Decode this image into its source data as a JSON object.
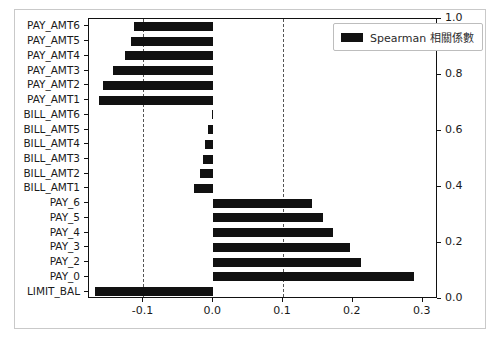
{
  "legend": {
    "label": "Spearman 相關係數",
    "swatch_color": "#111111"
  },
  "axis": {
    "x_ticks": [
      "-0.1",
      "0.0",
      "0.1",
      "0.2",
      "0.3"
    ],
    "right_ticks": [
      "0.0",
      "0.2",
      "0.4",
      "0.6",
      "0.8",
      "1.0"
    ]
  },
  "reference_lines": [
    -0.1,
    0.1
  ],
  "chart_data": {
    "type": "bar",
    "orientation": "horizontal",
    "title": "",
    "xlabel": "",
    "ylabel": "",
    "xlim": [
      -0.178,
      0.322
    ],
    "grid": false,
    "legend_position": "upper right",
    "series": [
      {
        "name": "Spearman 相關係數",
        "color": "#111111",
        "categories": [
          "PAY_AMT6",
          "PAY_AMT5",
          "PAY_AMT4",
          "PAY_AMT3",
          "PAY_AMT2",
          "PAY_AMT1",
          "BILL_AMT6",
          "BILL_AMT5",
          "BILL_AMT4",
          "BILL_AMT3",
          "BILL_AMT2",
          "BILL_AMT1",
          "PAY_6",
          "PAY_5",
          "PAY_4",
          "PAY_3",
          "PAY_2",
          "PAY_0",
          "LIMIT_BAL"
        ],
        "values": [
          -0.114,
          -0.118,
          -0.127,
          -0.144,
          -0.158,
          -0.163,
          -0.002,
          -0.008,
          -0.012,
          -0.014,
          -0.019,
          -0.027,
          0.142,
          0.157,
          0.172,
          0.196,
          0.212,
          0.288,
          -0.17
        ]
      }
    ],
    "x_ticks": [
      -0.1,
      0.0,
      0.1,
      0.2,
      0.3
    ],
    "right_axis": {
      "ticks": [
        0.0,
        0.2,
        0.4,
        0.6,
        0.8,
        1.0
      ],
      "ylim": [
        0.0,
        1.0
      ]
    },
    "reference_lines": {
      "values": [
        -0.1,
        0.1
      ],
      "style": "dashed",
      "color": "#555555"
    }
  }
}
